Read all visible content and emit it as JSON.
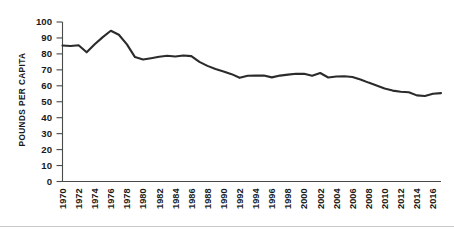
{
  "chart_data": {
    "type": "line",
    "title": "",
    "xlabel": "",
    "ylabel": "POUNDS PER CAPITA",
    "ylim": [
      0,
      100
    ],
    "xlim": [
      1970,
      2017
    ],
    "grid": false,
    "legend": null,
    "ytick_labels": [
      "100",
      "90",
      "80",
      "70",
      "60",
      "50",
      "40",
      "30",
      "20",
      "10",
      "0"
    ],
    "ytick_values": [
      100,
      90,
      80,
      70,
      60,
      50,
      40,
      30,
      20,
      10,
      0
    ],
    "xtick_labels": [
      "1970",
      "1972",
      "1974",
      "1976",
      "1978",
      "1980",
      "1982",
      "1984",
      "1986",
      "1988",
      "1990",
      "1992",
      "1994",
      "1996",
      "1998",
      "2000",
      "2002",
      "2004",
      "2006",
      "2008",
      "2010",
      "2012",
      "2014",
      "2016"
    ],
    "xtick_values": [
      1970,
      1972,
      1974,
      1976,
      1978,
      1980,
      1982,
      1984,
      1986,
      1988,
      1990,
      1992,
      1994,
      1996,
      1998,
      2000,
      2002,
      2004,
      2006,
      2008,
      2010,
      2012,
      2014,
      2016
    ],
    "series": [
      {
        "name": "Pounds per capita",
        "color": "#2b2b2b",
        "x": [
          1970,
          1971,
          1972,
          1973,
          1974,
          1975,
          1976,
          1977,
          1978,
          1979,
          1980,
          1981,
          1982,
          1983,
          1984,
          1985,
          1986,
          1987,
          1988,
          1989,
          1990,
          1991,
          1992,
          1993,
          1994,
          1995,
          1996,
          1997,
          1998,
          1999,
          2000,
          2001,
          2002,
          2003,
          2004,
          2005,
          2006,
          2007,
          2008,
          2009,
          2010,
          2011,
          2012,
          2013,
          2014,
          2015,
          2016,
          2017
        ],
        "values": [
          85.3,
          85.0,
          85.4,
          81.0,
          86.0,
          90.5,
          94.5,
          92.0,
          86.0,
          78.0,
          76.5,
          77.3,
          78.2,
          78.8,
          78.4,
          79.0,
          78.6,
          75.0,
          72.5,
          70.5,
          69.0,
          67.3,
          65.0,
          66.3,
          66.5,
          66.4,
          65.3,
          66.4,
          67.0,
          67.6,
          67.5,
          66.3,
          68.0,
          65.2,
          65.8,
          66.0,
          65.5,
          64.0,
          62.0,
          60.2,
          58.3,
          57.0,
          56.3,
          56.0,
          54.0,
          53.6,
          55.0,
          55.4
        ]
      }
    ]
  }
}
